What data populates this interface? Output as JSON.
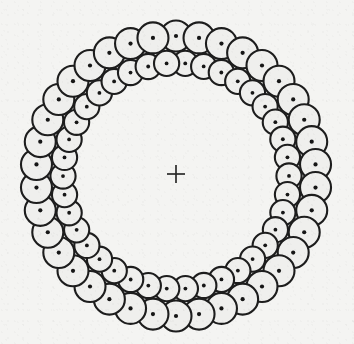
{
  "figure": {
    "background_color": "#f4f4f2",
    "stroke_color": "#1d1d1d",
    "fill_color": "#efefed",
    "dot_color": "#161616",
    "center": {
      "x": 176,
      "y": 176
    },
    "center_mark": {
      "name": "registration cross",
      "glyph": "+",
      "x": 176,
      "y": 174,
      "arm_length": 9,
      "color": "#2a2a2a"
    },
    "rings": [
      {
        "id": "outer-ring",
        "label": "outer row",
        "count": 38,
        "radius": 140,
        "circle_radius": 15.5,
        "dot_radius": 2.1,
        "start_angle_deg": -90
      },
      {
        "id": "inner-ring",
        "label": "inner row",
        "count": 38,
        "radius": 113,
        "circle_radius": 12.6,
        "dot_radius": 1.9,
        "start_angle_deg": -85.3
      }
    ],
    "extents": {
      "left": 22,
      "right": 330,
      "top": 14,
      "bottom": 338,
      "outer_diameter": 308
    }
  },
  "chart_data": {
    "type": "scatter",
    "xlabel": "",
    "ylabel": "",
    "xlim": [
      0,
      354
    ],
    "ylim": [
      344,
      0
    ],
    "grid": false,
    "legend": "none",
    "annotations": [
      {
        "text": "+",
        "x": 176,
        "y": 174,
        "role": "center registration mark"
      }
    ],
    "series": [
      {
        "name": "outer row",
        "count": 38,
        "ring_radius": 140,
        "marker_radius": 15.5,
        "marker": "circle-with-center-dot"
      },
      {
        "name": "inner row",
        "count": 38,
        "ring_radius": 113,
        "marker_radius": 12.6,
        "marker": "circle-with-center-dot"
      }
    ]
  }
}
